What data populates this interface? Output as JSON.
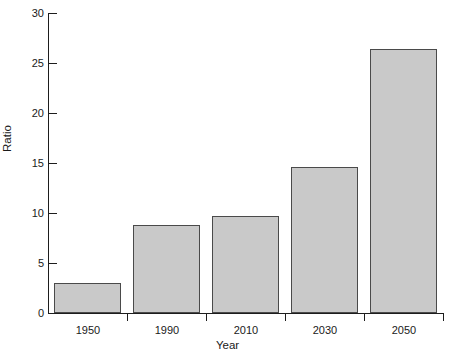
{
  "chart_data": {
    "type": "bar",
    "title": "",
    "xlabel": "Year",
    "ylabel": "Ratio",
    "categories": [
      "1950",
      "1990",
      "2010",
      "2030",
      "2050"
    ],
    "values": [
      3.0,
      8.8,
      9.7,
      14.6,
      26.4
    ],
    "ylim": [
      0,
      30
    ],
    "yticks": [
      0,
      5,
      10,
      15,
      20,
      25,
      30
    ],
    "ytick_labels": [
      "0",
      "5",
      "10",
      "15",
      "20",
      "25",
      "30"
    ],
    "grid": false,
    "legend": null,
    "bar_fill_color": "#c9c9c9",
    "bar_edge_color": "#4a4a4a",
    "axis_color": "#1d1d1d",
    "background_color": "#ffffff"
  }
}
